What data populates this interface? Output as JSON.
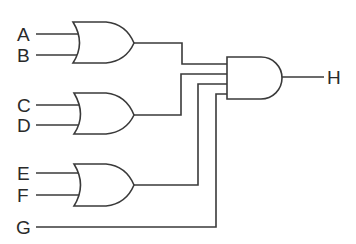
{
  "diagram": {
    "type": "logic-circuit",
    "inputs": [
      "A",
      "B",
      "C",
      "D",
      "E",
      "F",
      "G"
    ],
    "output": "H",
    "gates": [
      {
        "id": "or1",
        "type": "OR",
        "inputs": [
          "A",
          "B"
        ]
      },
      {
        "id": "or2",
        "type": "OR",
        "inputs": [
          "C",
          "D"
        ]
      },
      {
        "id": "or3",
        "type": "OR",
        "inputs": [
          "E",
          "F"
        ]
      },
      {
        "id": "and1",
        "type": "AND",
        "inputs": [
          "or1",
          "or2",
          "or3",
          "G"
        ],
        "output": "H"
      }
    ],
    "expression": "H = (A + B)(C + D)(E + F)G"
  },
  "labels": {
    "a": "A",
    "b": "B",
    "c": "C",
    "d": "D",
    "e": "E",
    "f": "F",
    "g": "G",
    "h": "H"
  },
  "colors": {
    "line": "#3a3a3a",
    "background": "#ffffff"
  }
}
